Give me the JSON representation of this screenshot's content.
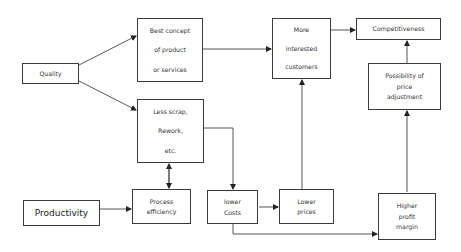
{
  "diagram": {
    "type": "flowchart",
    "nodes": {
      "quality": {
        "lines": [
          "Quality"
        ]
      },
      "best_concept": {
        "lines": [
          "Best concept",
          "of product",
          "or services"
        ]
      },
      "less_scrap": {
        "lines": [
          "Less scrap,",
          "Rework,",
          "etc."
        ]
      },
      "productivity": {
        "lines": [
          "Productivity"
        ]
      },
      "process_efficiency": {
        "lines": [
          "Process",
          "efficiency"
        ]
      },
      "lower_costs": {
        "lines": [
          "lower",
          "Costs"
        ]
      },
      "lower_prices": {
        "lines": [
          "Lower",
          "prices"
        ]
      },
      "more_interested": {
        "lines": [
          "More",
          "interested",
          "customers"
        ]
      },
      "competitiveness": {
        "lines": [
          "Competitiveness"
        ]
      },
      "price_adjustment": {
        "lines": [
          "Possibility of",
          "price",
          "adjustment"
        ]
      },
      "higher_profit": {
        "lines": [
          "Higher",
          "profit",
          "margin"
        ]
      }
    },
    "edges": [
      {
        "from": "Quality",
        "to": "Best concept of product or services"
      },
      {
        "from": "Quality",
        "to": "Less scrap, Rework, etc."
      },
      {
        "from": "Best concept of product or services",
        "to": "More interested customers"
      },
      {
        "from": "Less scrap, Rework, etc.",
        "to": "Lower Costs"
      },
      {
        "from": "Productivity",
        "to": "Process efficiency"
      },
      {
        "from": "Process efficiency",
        "to": "Less scrap, Rework, etc.",
        "bidirectional": true
      },
      {
        "from": "Lower Costs",
        "to": "Lower prices"
      },
      {
        "from": "Lower Costs",
        "to": "Higher profit margin"
      },
      {
        "from": "Lower prices",
        "to": "More interested customers"
      },
      {
        "from": "More interested customers",
        "to": "Competitiveness"
      },
      {
        "from": "Higher profit margin",
        "to": "Possibility of price adjustment"
      },
      {
        "from": "Possibility of price adjustment",
        "to": "Competitiveness"
      }
    ]
  }
}
